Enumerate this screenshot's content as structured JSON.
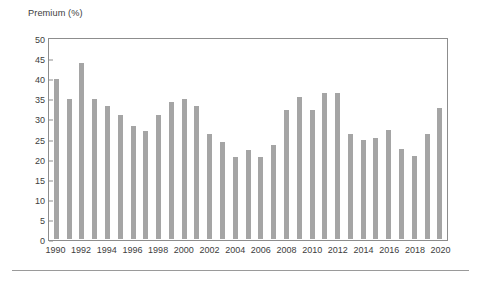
{
  "chart_data": {
    "type": "bar",
    "title": "",
    "ylabel": "Premium (%)",
    "xlabel": "",
    "ylim": [
      0,
      50
    ],
    "ytick_step": 5,
    "yticks": [
      50,
      45,
      40,
      35,
      30,
      25,
      20,
      15,
      10,
      5,
      0
    ],
    "grid": false,
    "legend": null,
    "bar_color": "#a5a5a5",
    "axis_color": "#8d8d8d",
    "text_color": "#3d3d3d",
    "xtick_labels": [
      "1990",
      "1992",
      "1994",
      "1996",
      "1998",
      "2000",
      "2002",
      "2004",
      "2006",
      "2008",
      "2010",
      "2012",
      "2014",
      "2016",
      "2018",
      "2020"
    ],
    "categories": [
      "1990",
      "1991",
      "1992",
      "1993",
      "1994",
      "1995",
      "1996",
      "1997",
      "1998",
      "1999",
      "2000",
      "2001",
      "2002",
      "2003",
      "2004",
      "2005",
      "2006",
      "2007",
      "2008",
      "2009",
      "2010",
      "2011",
      "2012",
      "2013",
      "2014",
      "2015",
      "2016",
      "2017",
      "2018",
      "2019",
      "2020"
    ],
    "values": [
      40.2,
      35.1,
      44.3,
      35.2,
      33.4,
      31.2,
      28.5,
      27.2,
      31.2,
      34.4,
      35.3,
      33.4,
      26.3,
      24.4,
      20.5,
      22.4,
      20.5,
      23.6,
      32.3,
      35.7,
      32.5,
      36.6,
      36.6,
      26.4,
      25.0,
      25.3,
      27.4,
      22.6,
      20.9,
      26.4,
      32.8
    ]
  }
}
